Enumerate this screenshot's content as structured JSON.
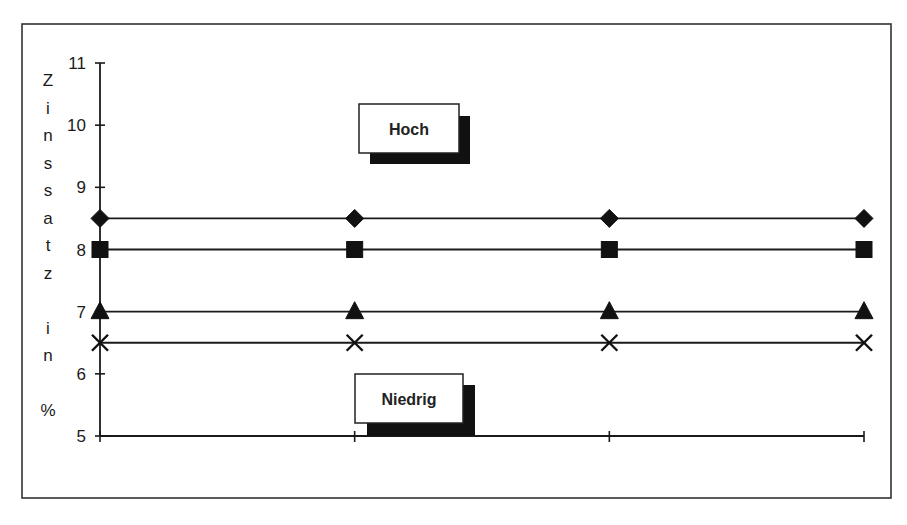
{
  "chart_data": {
    "type": "line",
    "title": "",
    "xlabel": "",
    "ylabel": "Zinssatz in %",
    "ylabel_chars": [
      "Z",
      "i",
      "n",
      "s",
      "s",
      "a",
      "t",
      "z",
      "",
      "i",
      "n",
      "",
      "%"
    ],
    "categories": [
      "1",
      "2",
      "3",
      "4"
    ],
    "x_tick_labels_visible": false,
    "ylim": [
      5,
      11
    ],
    "yticks": [
      5,
      6,
      7,
      8,
      9,
      10,
      11
    ],
    "grid": false,
    "legend": null,
    "series": [
      {
        "name": "Serie 1",
        "marker": "diamond",
        "values": [
          8.5,
          8.5,
          8.5,
          8.5
        ]
      },
      {
        "name": "Serie 2",
        "marker": "square",
        "values": [
          8.0,
          8.0,
          8.0,
          8.0
        ]
      },
      {
        "name": "Serie 3",
        "marker": "triangle",
        "values": [
          7.0,
          7.0,
          7.0,
          7.0
        ]
      },
      {
        "name": "Serie 4",
        "marker": "x",
        "values": [
          6.5,
          6.5,
          6.5,
          6.5
        ]
      }
    ],
    "annotations": [
      {
        "text": "Hoch",
        "position": "upper-middle"
      },
      {
        "text": "Niedrig",
        "position": "lower-middle"
      }
    ]
  }
}
